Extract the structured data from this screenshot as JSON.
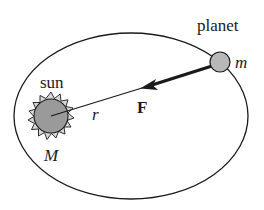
{
  "diagram": {
    "labels": {
      "planet": "planet",
      "planet_mass": "m",
      "sun": "sun",
      "sun_mass": "M",
      "distance": "r",
      "force": "F"
    },
    "colors": {
      "stroke": "#1a1a1a",
      "sun_fill": "#9a9a9a",
      "corona_fill": "#d8d8d8",
      "planet_fill": "#b8b8b8",
      "background": "#ffffff"
    },
    "elements": {
      "orbit": "ellipse",
      "sun": "circle with spiky corona",
      "planet": "small circle on orbit",
      "force_vector": "arrow from planet toward sun",
      "radius_line": "line from sun center to planet"
    }
  }
}
